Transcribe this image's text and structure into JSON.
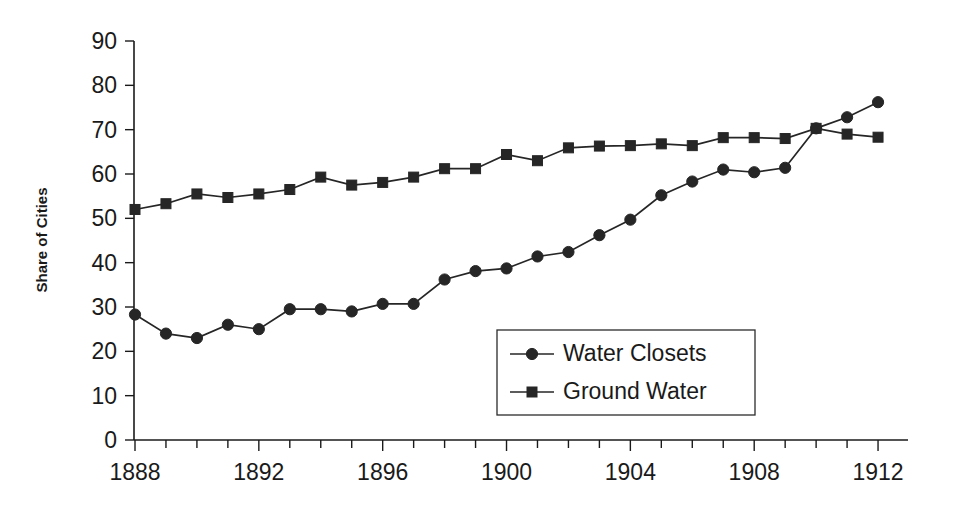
{
  "chart_data": {
    "type": "line",
    "title": "",
    "xlabel": "",
    "ylabel": "Share of Cities",
    "xlim": [
      1888,
      1912
    ],
    "ylim": [
      0,
      90
    ],
    "y_ticks": [
      0,
      10,
      20,
      30,
      40,
      50,
      60,
      70,
      80,
      90
    ],
    "y_tick_labels": [
      "0",
      "10",
      "20",
      "30",
      "40",
      "50",
      "60",
      "70",
      "80",
      "90"
    ],
    "x_ticks": [
      1888,
      1889,
      1890,
      1891,
      1892,
      1893,
      1894,
      1895,
      1896,
      1897,
      1898,
      1899,
      1900,
      1901,
      1902,
      1903,
      1904,
      1905,
      1906,
      1907,
      1908,
      1909,
      1910,
      1911,
      1912
    ],
    "x_tick_labels_shown": [
      "1888",
      "1892",
      "1896",
      "1900",
      "1904",
      "1908",
      "1912"
    ],
    "x_labeled_years": [
      1888,
      1892,
      1896,
      1900,
      1904,
      1908,
      1912
    ],
    "grid": false,
    "legend_position": "inside-center-lower",
    "x": [
      1888,
      1889,
      1890,
      1891,
      1892,
      1893,
      1894,
      1895,
      1896,
      1897,
      1898,
      1899,
      1900,
      1901,
      1902,
      1903,
      1904,
      1905,
      1906,
      1907,
      1908,
      1909,
      1910,
      1911,
      1912
    ],
    "series": [
      {
        "name": "Water Closets",
        "marker": "circle",
        "color": "#262626",
        "values": [
          28.3,
          24.0,
          23.0,
          26.0,
          25.0,
          29.5,
          29.5,
          29.0,
          30.7,
          30.7,
          36.2,
          38.1,
          38.7,
          41.4,
          42.4,
          46.2,
          49.7,
          55.2,
          58.3,
          61.0,
          60.4,
          61.4,
          70.3,
          72.8,
          76.2
        ]
      },
      {
        "name": "Ground Water",
        "marker": "square",
        "color": "#262626",
        "values": [
          52.0,
          53.3,
          55.5,
          54.7,
          55.5,
          56.5,
          59.3,
          57.5,
          58.1,
          59.3,
          61.2,
          61.2,
          64.4,
          63.0,
          65.9,
          66.3,
          66.4,
          66.8,
          66.4,
          68.2,
          68.2,
          68.0,
          70.3,
          69.0,
          68.3
        ]
      }
    ],
    "legend_entries": [
      "Water Closets",
      "Ground Water"
    ]
  },
  "colors": {
    "axis": "#1a1a1a",
    "series": "#262626",
    "background": "#ffffff",
    "legend_border": "#2b2b2b"
  }
}
